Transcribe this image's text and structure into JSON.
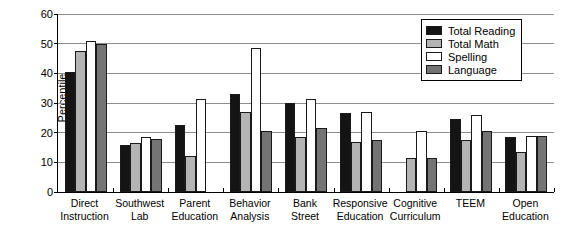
{
  "chart_data": {
    "type": "bar",
    "title": "",
    "subtitle": "",
    "xlabel": "",
    "ylabel": "Percentile",
    "ylim": [
      0,
      60
    ],
    "yticks": [
      0,
      10,
      20,
      30,
      40,
      50,
      60
    ],
    "grid": true,
    "legend_position": "top-right",
    "categories": [
      "Direct Instruction",
      "Southwest Lab",
      "Parent Education",
      "Behavior Analysis",
      "Bank Street",
      "Responsive Education",
      "Cognitive Curriculum",
      "TEEM",
      "Open Education"
    ],
    "category_lines": [
      [
        "Direct",
        "Instruction"
      ],
      [
        "Southwest",
        "Lab"
      ],
      [
        "Parent",
        "Education"
      ],
      [
        "Behavior",
        "Analysis"
      ],
      [
        "Bank",
        "Street"
      ],
      [
        "Responsive",
        "Education"
      ],
      [
        "Cognitive",
        "Curriculum"
      ],
      [
        "TEEM",
        ""
      ],
      [
        "Open",
        "Education"
      ]
    ],
    "series": [
      {
        "name": "Total Reading",
        "color": "#141414",
        "values": [
          40.5,
          16,
          22.5,
          33,
          30,
          26.5,
          null,
          24.5,
          18.5
        ]
      },
      {
        "name": "Total Math",
        "color": "#b4b4b4",
        "values": [
          47.5,
          16.5,
          12,
          27,
          18.5,
          17,
          11.5,
          17.5,
          13.5
        ]
      },
      {
        "name": "Spelling",
        "color": "#ffffff",
        "values": [
          51,
          18.5,
          31.5,
          48.5,
          31.5,
          27,
          20.5,
          26,
          19
        ]
      },
      {
        "name": "Language",
        "color": "#747474",
        "values": [
          50,
          18,
          null,
          20.5,
          21.5,
          17.5,
          11.5,
          20.5,
          19
        ]
      }
    ]
  }
}
